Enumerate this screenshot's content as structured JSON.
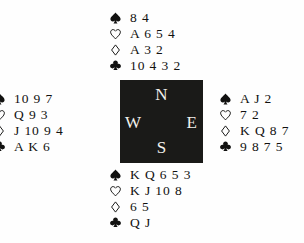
{
  "diagram": {
    "type": "bridge-deal-diagram",
    "background_color": "#fefefe",
    "text_color": "#111110"
  },
  "compass": {
    "box_color": "#1a1a18",
    "letter_color": "#f2f0ec",
    "north": "N",
    "west": "W",
    "east": "E",
    "south": "S"
  },
  "suits": {
    "spade": {
      "name": "spade-suit-symbol",
      "glyph": "♠",
      "fill": "solid"
    },
    "heart": {
      "name": "heart-suit-symbol",
      "glyph": "♡",
      "fill": "outline"
    },
    "diamond": {
      "name": "diamond-suit-symbol",
      "glyph": "♢",
      "fill": "outline"
    },
    "club": {
      "name": "club-suit-symbol",
      "glyph": "♣",
      "fill": "solid"
    }
  },
  "hands": {
    "north": {
      "position": "North",
      "spades": "8 4",
      "hearts": "A 6 5 4",
      "diamonds": "A 3 2",
      "clubs": "10 4 3 2"
    },
    "west": {
      "position": "West",
      "spades": "10 9 7",
      "hearts": "Q 9 3",
      "diamonds": "J 10 9 4",
      "clubs": "A K 6"
    },
    "east": {
      "position": "East",
      "spades": "A J 2",
      "hearts": "7 2",
      "diamonds": "K Q 8 7",
      "clubs": "9 8 7 5"
    },
    "south": {
      "position": "South",
      "spades": "K Q 6 5 3",
      "hearts": "K J 10 8",
      "diamonds": "6 5",
      "clubs": "Q J"
    }
  }
}
